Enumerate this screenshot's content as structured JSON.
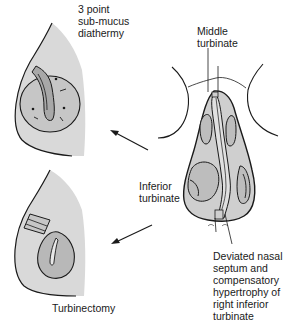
{
  "diagram": {
    "colors": {
      "background": "#ffffff",
      "tissue_fill": "#d9d9d9",
      "turbinate_fill": "#bdbdbd",
      "inner_fill": "#a8a8a8",
      "stroke": "#1a1a1a"
    },
    "labels": {
      "diathermy": "3 point\nsub-mucus\ndiathermy",
      "middle_turbinate": "Middle\nturbinate",
      "inferior_turbinate": "Inferior\nturbinate",
      "deviated_septum": "Deviated nasal\nseptum and\ncompensatory\nhypertrophy of\nright inferior\nturbinate",
      "turbinectomy": "Turbinectomy"
    },
    "panels": [
      {
        "id": "diathermy-panel",
        "procedure": "3 point sub-mucus diathermy"
      },
      {
        "id": "turbinectomy-panel",
        "procedure": "Turbinectomy"
      },
      {
        "id": "nasal-cavity-panel",
        "structures": [
          "Middle turbinate",
          "Inferior turbinate",
          "Deviated nasal septum"
        ]
      }
    ],
    "arrows": [
      {
        "id": "arrow-to-diathermy",
        "direction": "up-left"
      },
      {
        "id": "arrow-to-turbinectomy",
        "direction": "down-left"
      }
    ]
  }
}
